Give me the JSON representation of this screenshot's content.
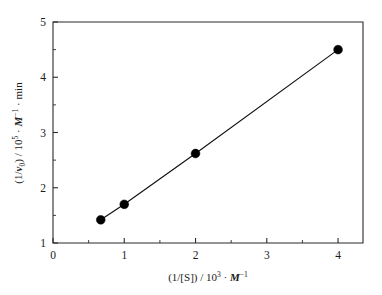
{
  "chart_data": {
    "type": "line",
    "title": "",
    "subtitle": "",
    "xlabel_parts": {
      "base": "(1/[S]) / 10",
      "exponent": "3",
      "separator": " · ",
      "unit_italic": "M",
      "unit_exponent": "−1"
    },
    "xlabel": "(1/[S]) / 10^3 · M^-1",
    "ylabel_parts": {
      "base_open": "(1/",
      "var_italic": "v",
      "var_sub": "0",
      "base_close": ") / 10",
      "exponent": "5",
      "separator": " · ",
      "unit_italic": "M",
      "unit_exponent": "−1",
      "tail": " · min"
    },
    "ylabel": "(1/v_0) / 10^5 · M^-1 · min",
    "x": [
      0.67,
      1.0,
      2.0,
      4.0
    ],
    "values": [
      1.42,
      1.7,
      2.62,
      4.5
    ],
    "series": [
      {
        "name": "1/v0 vs 1/[S]",
        "points": [
          {
            "x": 0.67,
            "y": 1.42
          },
          {
            "x": 1.0,
            "y": 1.7
          },
          {
            "x": 2.0,
            "y": 2.62
          },
          {
            "x": 4.0,
            "y": 4.5
          }
        ]
      }
    ],
    "xlim": [
      0,
      4.35
    ],
    "ylim": [
      1,
      5
    ],
    "xticks": [
      0,
      1,
      2,
      3,
      4
    ],
    "xticklabels": [
      "0",
      "1",
      "2",
      "3",
      "4"
    ],
    "xminorticks": [
      0.5,
      1.5,
      2.5,
      3.5
    ],
    "yticks": [
      1,
      2,
      3,
      4,
      5
    ],
    "yticklabels": [
      "1",
      "2",
      "3",
      "4",
      "5"
    ],
    "yminorticks": [
      1.5,
      2.5,
      3.5,
      4.5
    ],
    "grid": false,
    "legend": false,
    "legend_position": "none",
    "marker": "filled-circle",
    "marker_color": "#000000",
    "line_color": "#111111",
    "axis_color": "#2b2b2b",
    "background_color": "#ffffff"
  }
}
